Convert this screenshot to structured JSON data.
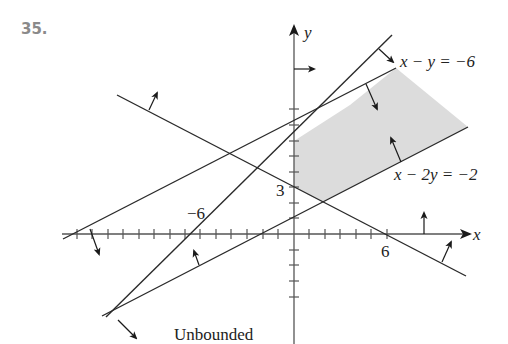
{
  "problem": {
    "number": "35."
  },
  "axes": {
    "x_label": "x",
    "y_label": "y",
    "x_tick_labels": [
      {
        "value": -6,
        "text": "−6"
      },
      {
        "value": 6,
        "text": "6"
      }
    ],
    "y_tick_labels": [
      {
        "value": 3,
        "text": "3"
      }
    ]
  },
  "equations": {
    "line1": "x − y = −6",
    "line2": "x − 2y = −2"
  },
  "annotations": {
    "region_label": "Unbounded"
  },
  "colors": {
    "line": "#2a2a2a",
    "axis": "#555555",
    "shade": "#dcdcdc",
    "problem_number": "#8a8a8a"
  }
}
